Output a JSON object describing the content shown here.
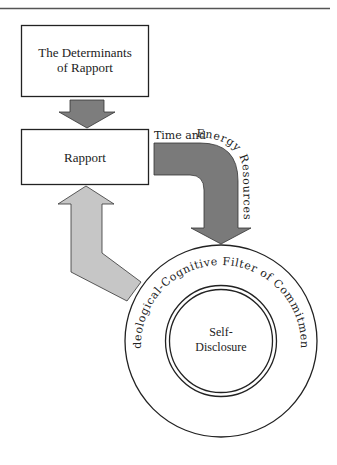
{
  "diagram": {
    "boxes": {
      "determinants": {
        "label_line1": "The Determinants",
        "label_line2": "of Rapport"
      },
      "rapport": {
        "label": "Rapport"
      }
    },
    "arrows": {
      "determinants_to_rapport": {
        "color": "#7d7d7d"
      },
      "resources_arrow": {
        "color": "#7a7a7a",
        "label_straight": "Time and ",
        "label_curved": "Energy Resources"
      },
      "feedback_arrow": {
        "color": "#c6c6c6"
      }
    },
    "circles": {
      "outer_ring_label": "Ideological-Cognitive Filter of Commitment",
      "core_label_line1": "Self-",
      "core_label_line2": "Disclosure"
    },
    "colors": {
      "stroke": "#222222",
      "dark_arrow": "#7a7a7a",
      "light_arrow": "#c6c6c6",
      "rule": "#555555"
    }
  }
}
